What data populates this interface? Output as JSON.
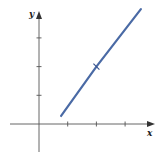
{
  "chart_data": {
    "type": "line",
    "title": "",
    "xlabel": "x",
    "ylabel": "y",
    "xlim": [
      -1,
      4
    ],
    "ylim": [
      -1,
      4
    ],
    "grid": false,
    "legend": null,
    "x_ticks": [
      1,
      2,
      3
    ],
    "y_ticks": [
      1,
      2,
      3
    ],
    "tick_labels_shown": false,
    "series": [
      {
        "name": "line",
        "color": "#4a6aa5",
        "x": [
          0.77,
          2,
          3.55
        ],
        "y": [
          0.28,
          2,
          4.0
        ]
      }
    ],
    "annotations": [
      {
        "type": "tick-mark-on-line",
        "x": 2,
        "y": 2
      }
    ]
  },
  "axes": {
    "x_label": "x",
    "y_label": "y",
    "axis_color": "#555555"
  },
  "layout": {
    "origin_px": [
      39,
      124
    ],
    "unit_px": 28.7
  }
}
